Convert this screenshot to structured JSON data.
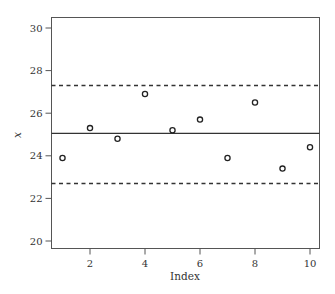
{
  "chart_data": {
    "type": "scatter",
    "title": "",
    "xlabel": "Index",
    "ylabel": "x",
    "xlim": [
      0.6,
      10.3
    ],
    "ylim": [
      19.6,
      30.4
    ],
    "grid": false,
    "legend": null,
    "x_ticks": [
      2,
      4,
      6,
      8,
      10
    ],
    "y_ticks": [
      20,
      22,
      24,
      26,
      28,
      30
    ],
    "x": [
      1,
      2,
      3,
      4,
      5,
      6,
      7,
      8,
      9,
      10
    ],
    "values": [
      23.9,
      25.3,
      24.8,
      26.9,
      25.2,
      25.7,
      23.9,
      26.5,
      23.4,
      24.4
    ],
    "reference_lines": [
      {
        "name": "center",
        "y": 25.05,
        "style": "solid"
      },
      {
        "name": "upper-limit",
        "y": 27.3,
        "style": "dashed"
      },
      {
        "name": "lower-limit",
        "y": 22.7,
        "style": "dashed"
      }
    ],
    "marker": "open-circle",
    "colors": {
      "line": "#333333",
      "marker": "#222222",
      "axis": "#555555"
    }
  }
}
